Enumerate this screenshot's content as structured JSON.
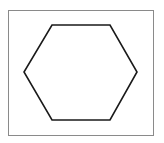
{
  "figure": {
    "background": "#ffffff",
    "frame": {
      "x": 8.5,
      "y": 10.5,
      "width": 145,
      "height": 125,
      "stroke": "#8a8a8a",
      "stroke_width": 1
    },
    "shape": {
      "type": "hexagon",
      "points": "52,25 110,25 137,72 110,120 52,120 24,72",
      "stroke": "#1a1a1a",
      "stroke_width": 1.6,
      "fill": "none"
    }
  }
}
